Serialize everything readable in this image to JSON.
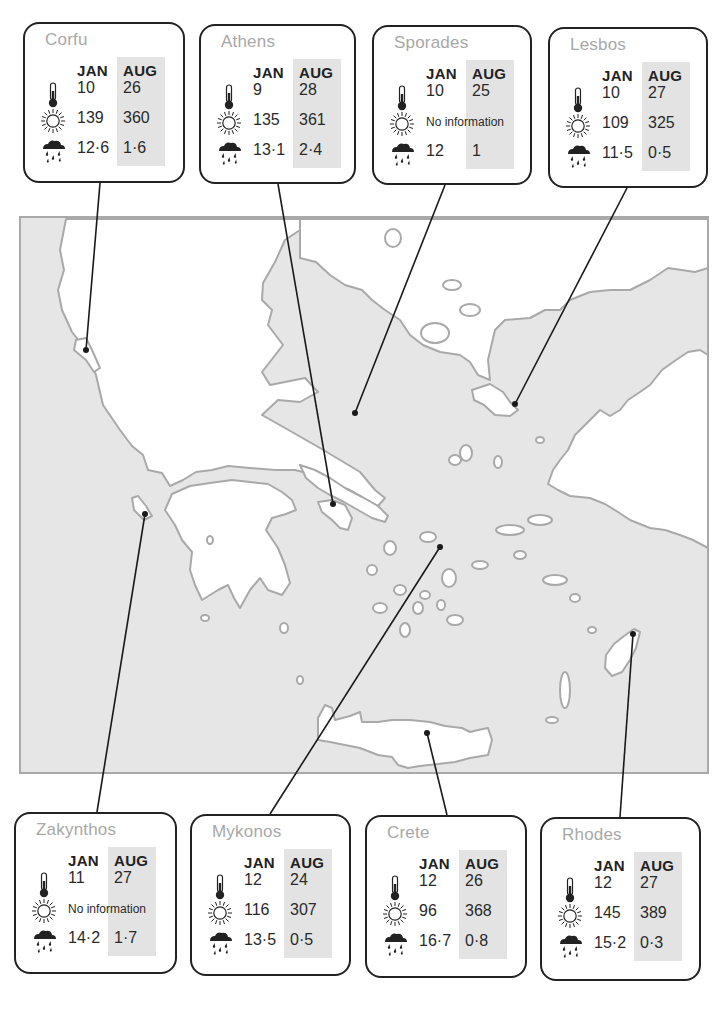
{
  "colors": {
    "sea": "#e6e6e6",
    "land": "#ffffff",
    "coastline": "#a9a9a9",
    "connector": "#1a1a1a",
    "card_border": "#222222",
    "aug_highlight": "#e3e3e3",
    "location_name": "#a8a8a8"
  },
  "legend": {
    "column_jan": "JAN",
    "column_aug": "AUG",
    "icons": [
      "thermometer-icon",
      "sun-icon",
      "rain-cloud-icon"
    ],
    "no_info_text": "No information"
  },
  "locations": [
    {
      "id": "corfu",
      "name": "Corfu",
      "temp_jan": "10",
      "temp_aug": "26",
      "sun_jan": "139",
      "sun_aug": "360",
      "sun_no_info": false,
      "rain_jan": "12·6",
      "rain_aug": "1·6"
    },
    {
      "id": "athens",
      "name": "Athens",
      "temp_jan": "9",
      "temp_aug": "28",
      "sun_jan": "135",
      "sun_aug": "361",
      "sun_no_info": false,
      "rain_jan": "13·1",
      "rain_aug": "2·4"
    },
    {
      "id": "sporades",
      "name": "Sporades",
      "temp_jan": "10",
      "temp_aug": "25",
      "sun_jan": "",
      "sun_aug": "",
      "sun_no_info": true,
      "sun_text": "No information",
      "rain_jan": "12",
      "rain_aug": "1"
    },
    {
      "id": "lesbos",
      "name": "Lesbos",
      "temp_jan": "10",
      "temp_aug": "27",
      "sun_jan": "109",
      "sun_aug": "325",
      "sun_no_info": false,
      "rain_jan": "11·5",
      "rain_aug": "0·5"
    },
    {
      "id": "zakynthos",
      "name": "Zakynthos",
      "temp_jan": "11",
      "temp_aug": "27",
      "sun_jan": "",
      "sun_aug": "",
      "sun_no_info": true,
      "sun_text": "No information",
      "rain_jan": "14·2",
      "rain_aug": "1·7"
    },
    {
      "id": "mykonos",
      "name": "Mykonos",
      "temp_jan": "12",
      "temp_aug": "24",
      "sun_jan": "116",
      "sun_aug": "307",
      "sun_no_info": false,
      "rain_jan": "13·5",
      "rain_aug": "0·5"
    },
    {
      "id": "crete",
      "name": "Crete",
      "temp_jan": "12",
      "temp_aug": "26",
      "sun_jan": "96",
      "sun_aug": "368",
      "sun_no_info": false,
      "rain_jan": "16·7",
      "rain_aug": "0·8"
    },
    {
      "id": "rhodes",
      "name": "Rhodes",
      "temp_jan": "12",
      "temp_aug": "27",
      "sun_jan": "145",
      "sun_aug": "389",
      "sun_no_info": false,
      "rain_jan": "15·2",
      "rain_aug": "0·3"
    }
  ]
}
